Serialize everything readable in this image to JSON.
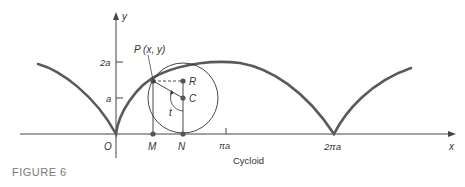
{
  "figure": {
    "caption": "FIGURE 6",
    "subtitle": "Cycloid"
  },
  "axes": {
    "x_label": "x",
    "y_label": "y",
    "origin_label": "O",
    "y_ticks": [
      "2a",
      "a"
    ],
    "x_ticks": [
      "πa",
      "2πa"
    ]
  },
  "points": {
    "P": "P (x, y)",
    "R": "R",
    "C": "C",
    "M": "M",
    "N": "N",
    "t": "t"
  },
  "colors": {
    "curve": "#5a5a5a",
    "axis": "#444444",
    "caption": "#7a7a7a"
  }
}
